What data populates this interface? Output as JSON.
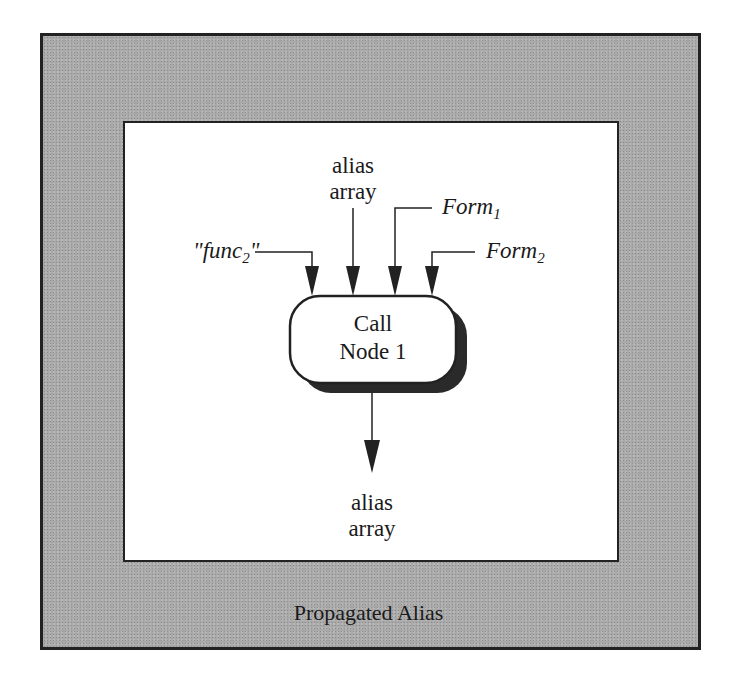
{
  "diagram": {
    "outer_box": {
      "caption": "Propagated Alias",
      "fill": "#a9a9a9"
    },
    "inputs": {
      "alias_array_top": {
        "line1": "alias",
        "line2": "array"
      },
      "func_label": {
        "prefix": "\"func",
        "sub": "2",
        "suffix": "\""
      },
      "form1": {
        "text": "Form",
        "sub": "1"
      },
      "form2": {
        "text": "Form",
        "sub": "2"
      }
    },
    "call_node": {
      "line1": "Call",
      "line2": "Node 1"
    },
    "output": {
      "line1": "alias",
      "line2": "array"
    }
  }
}
